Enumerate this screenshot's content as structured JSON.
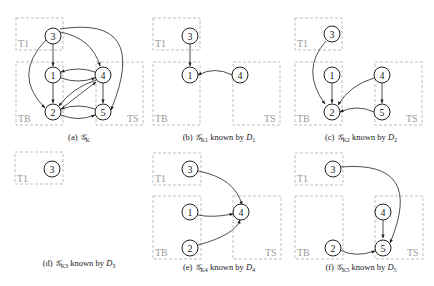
{
  "figure": {
    "panels": [
      {
        "id": "a",
        "caption_prefix": "(a) ",
        "graph": "𝒢",
        "sub": "K",
        "suffix": "",
        "known_by": "",
        "dsub": ""
      },
      {
        "id": "b",
        "caption_prefix": "(b) ",
        "graph": "𝒢",
        "sub": "K1",
        "suffix": " known by ",
        "known_by": "D",
        "dsub": "1"
      },
      {
        "id": "c",
        "caption_prefix": "(c) ",
        "graph": "𝒢",
        "sub": "K2",
        "suffix": " known by ",
        "known_by": "D",
        "dsub": "2"
      },
      {
        "id": "d",
        "caption_prefix": "(d) ",
        "graph": "𝒢",
        "sub": "K3",
        "suffix": " known by ",
        "known_by": "D",
        "dsub": "3"
      },
      {
        "id": "e",
        "caption_prefix": "(e) ",
        "graph": "𝒢",
        "sub": "K4",
        "suffix": " known by ",
        "known_by": "D",
        "dsub": "4"
      },
      {
        "id": "f",
        "caption_prefix": "(f) ",
        "graph": "𝒢",
        "sub": "K5",
        "suffix": " known by ",
        "known_by": "D",
        "dsub": "5"
      }
    ],
    "tiers": {
      "t1": "T1",
      "tb": "TB",
      "ts": "TS"
    },
    "nodes": {
      "n1": "1",
      "n2": "2",
      "n3": "3",
      "n4": "4",
      "n5": "5"
    },
    "edges": {
      "a": [
        "3→1",
        "3→4",
        "3→2",
        "3→5",
        "1→2",
        "4→1",
        "1→4",
        "4→2",
        "2→4",
        "4→5",
        "2→5",
        "5→2"
      ],
      "b": [
        "3→1",
        "4→1"
      ],
      "c": [
        "3→2",
        "1→2",
        "4→2",
        "4→5",
        "5→2"
      ],
      "d": [],
      "e": [
        "3→4",
        "1→4",
        "2→4"
      ],
      "f": [
        "3→5",
        "4→5",
        "2→5"
      ]
    },
    "colors": {
      "node_stroke": "#222222",
      "box_stroke": "#b8b8b8",
      "label": "#9a9a9a"
    }
  }
}
